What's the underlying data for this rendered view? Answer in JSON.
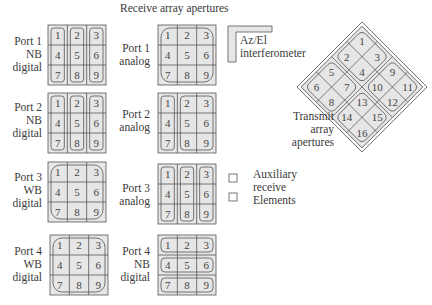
{
  "title": "Receive array apertures",
  "colors": {
    "cell_fill": "#e6e6e6",
    "line": "#555555",
    "background": "#ffffff"
  },
  "receive_arrays": [
    {
      "id": "port1-nb-digital",
      "label": [
        "Port 1",
        "NB",
        "digital"
      ],
      "elements": [
        "1",
        "2",
        "3",
        "4",
        "5",
        "6",
        "7",
        "8",
        "9"
      ],
      "grouping": "columns",
      "groups": [
        [
          "1",
          "4",
          "7"
        ],
        [
          "2",
          "5",
          "8"
        ],
        [
          "3",
          "6",
          "9"
        ]
      ]
    },
    {
      "id": "port1-analog",
      "label": [
        "Port 1",
        "analog"
      ],
      "elements": [
        "1",
        "2",
        "3",
        "4",
        "5",
        "6",
        "7",
        "8",
        "9"
      ],
      "grouping": "all",
      "groups": [
        [
          "1",
          "2",
          "3",
          "4",
          "5",
          "6",
          "7",
          "8",
          "9"
        ]
      ]
    },
    {
      "id": "port2-nb-digital",
      "label": [
        "Port 2",
        "NB",
        "digital"
      ],
      "elements": [
        "1",
        "2",
        "3",
        "4",
        "5",
        "6",
        "7",
        "8",
        "9"
      ],
      "grouping": "columns",
      "groups": [
        [
          "1",
          "4",
          "7"
        ],
        [
          "2",
          "5",
          "8"
        ],
        [
          "3",
          "6",
          "9"
        ]
      ]
    },
    {
      "id": "port2-analog",
      "label": [
        "Port 2",
        "analog"
      ],
      "elements": [
        "1",
        "2",
        "3",
        "4",
        "5",
        "6",
        "7",
        "8",
        "9"
      ],
      "grouping": "col1-plus-rest",
      "groups": [
        [
          "1",
          "4",
          "7"
        ],
        [
          "2",
          "3",
          "5",
          "6",
          "8",
          "9"
        ]
      ]
    },
    {
      "id": "port3-wb-digital",
      "label": [
        "Port 3",
        "WB",
        "digital"
      ],
      "elements": [
        "1",
        "2",
        "3",
        "4",
        "5",
        "6",
        "7",
        "8",
        "9"
      ],
      "grouping": "all",
      "groups": [
        [
          "1",
          "2",
          "3",
          "4",
          "5",
          "6",
          "7",
          "8",
          "9"
        ]
      ]
    },
    {
      "id": "port3-analog",
      "label": [
        "Port 3",
        "analog"
      ],
      "elements": [
        "1",
        "2",
        "3",
        "4",
        "5",
        "6",
        "7",
        "8",
        "9"
      ],
      "grouping": "columns",
      "groups": [
        [
          "1",
          "4",
          "7"
        ],
        [
          "2",
          "5",
          "8"
        ],
        [
          "3",
          "6",
          "9"
        ]
      ]
    },
    {
      "id": "port4-wb-digital",
      "label": [
        "Port 4",
        "WB",
        "digital"
      ],
      "elements": [
        "1",
        "2",
        "3",
        "4",
        "5",
        "6",
        "7",
        "8",
        "9"
      ],
      "grouping": "all",
      "groups": [
        [
          "1",
          "2",
          "3",
          "4",
          "5",
          "6",
          "7",
          "8",
          "9"
        ]
      ]
    },
    {
      "id": "port4-nb-digital",
      "label": [
        "Port 4",
        "NB",
        "digital"
      ],
      "elements": [
        "1",
        "2",
        "3",
        "4",
        "5",
        "6",
        "7",
        "8",
        "9"
      ],
      "grouping": "rows",
      "groups": [
        [
          "1",
          "2",
          "3"
        ],
        [
          "4",
          "5",
          "6"
        ],
        [
          "7",
          "8",
          "9"
        ]
      ]
    }
  ],
  "interferometer": {
    "label": [
      "Az/El",
      "interferometer"
    ]
  },
  "transmit": {
    "label": [
      "Transmit",
      "array",
      "apertures"
    ],
    "quadrants": [
      {
        "name": "top",
        "elements": [
          "1",
          "2",
          "3",
          "4"
        ]
      },
      {
        "name": "left",
        "elements": [
          "5",
          "6",
          "7",
          "8"
        ]
      },
      {
        "name": "right",
        "elements": [
          "9",
          "10",
          "11",
          "12"
        ]
      },
      {
        "name": "bottom",
        "elements": [
          "13",
          "14",
          "15",
          "16"
        ]
      }
    ]
  },
  "auxiliary": {
    "label": [
      "Auxiliary",
      "receive",
      "Elements"
    ]
  }
}
